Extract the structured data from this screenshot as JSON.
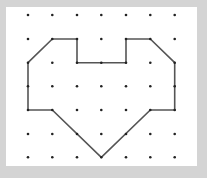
{
  "diagram": {
    "type": "dot-grid-polygon",
    "grid": {
      "columns": 7,
      "rows": 7,
      "x_positions": [
        28,
        52.3,
        77,
        101.3,
        126,
        150.3,
        174.7
      ],
      "y_positions": [
        15,
        39,
        62.7,
        86.3,
        110,
        134,
        157.3
      ]
    },
    "shape": {
      "name": "heart-like polygon",
      "vertices_grid": [
        [
          1,
          1
        ],
        [
          2,
          1
        ],
        [
          2,
          2
        ],
        [
          4,
          2
        ],
        [
          4,
          1
        ],
        [
          5,
          1
        ],
        [
          6,
          2
        ],
        [
          6,
          4
        ],
        [
          5,
          4
        ],
        [
          3,
          6
        ],
        [
          1,
          4
        ],
        [
          0,
          4
        ],
        [
          0,
          2
        ]
      ],
      "stroke_color": "#555555"
    },
    "colors": {
      "background": "#d4d4d4",
      "canvas": "#ffffff",
      "dot": "#222222"
    }
  }
}
